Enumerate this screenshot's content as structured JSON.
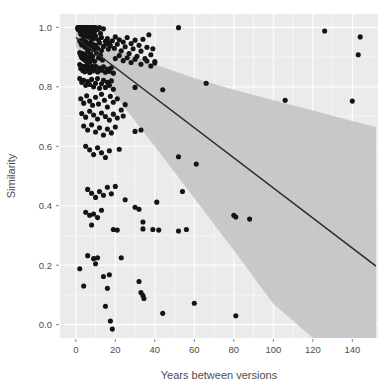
{
  "chart_data": {
    "type": "scatter",
    "title": "",
    "xlabel": "Years between versions",
    "ylabel": "Similarity",
    "xlim": [
      -8,
      153
    ],
    "ylim": [
      -0.045,
      1.045
    ],
    "xticks": [
      0,
      20,
      40,
      60,
      80,
      100,
      120,
      140
    ],
    "xticklabels": [
      "0",
      "20",
      "40",
      "60",
      "80",
      "100",
      "120",
      "140"
    ],
    "yticks": [
      0.0,
      0.2,
      0.4,
      0.6,
      0.8,
      1.0
    ],
    "yticklabels": [
      "0.0",
      "0.2",
      "0.4",
      "0.6",
      "0.8",
      "1.0"
    ],
    "grid": true,
    "grid_color": "#ffffff",
    "panel_background": "#ebebeb",
    "legend": null,
    "point_color": "#141414",
    "fit_line_color": "#2b2b2b",
    "ci_band_color": "#bfbfbf",
    "fit_line": {
      "label": "linear regression fit",
      "x": [
        0,
        152
      ],
      "y": [
        0.966,
        0.197
      ],
      "slope": -0.00506,
      "intercept": 0.966
    },
    "confidence_band": {
      "label": "95% confidence interval",
      "x": [
        0,
        20,
        40,
        60,
        80,
        100,
        120,
        140,
        152
      ],
      "upper": [
        0.995,
        0.93,
        0.875,
        0.83,
        0.79,
        0.755,
        0.72,
        0.685,
        0.665
      ],
      "lower": [
        0.935,
        0.77,
        0.6,
        0.425,
        0.25,
        0.07,
        -0.045,
        -0.045,
        -0.045
      ]
    },
    "points": [
      [
        1.0,
        0.999
      ],
      [
        1.0,
        0.996
      ],
      [
        1.2,
        0.993
      ],
      [
        1.5,
        0.999
      ],
      [
        1.8,
        0.996
      ],
      [
        2.0,
        0.999
      ],
      [
        2.0,
        0.99
      ],
      [
        2.2,
        0.985
      ],
      [
        2.5,
        0.999
      ],
      [
        2.5,
        0.978
      ],
      [
        2.8,
        0.996
      ],
      [
        3.0,
        0.999
      ],
      [
        3.0,
        0.991
      ],
      [
        3.0,
        0.975
      ],
      [
        3.2,
        0.999
      ],
      [
        3.5,
        0.994
      ],
      [
        3.5,
        0.982
      ],
      [
        3.8,
        0.999
      ],
      [
        4.0,
        0.999
      ],
      [
        4.0,
        0.988
      ],
      [
        4.0,
        0.972
      ],
      [
        4.2,
        0.999
      ],
      [
        4.5,
        0.993
      ],
      [
        4.5,
        0.98
      ],
      [
        4.8,
        0.999
      ],
      [
        5.0,
        0.999
      ],
      [
        5.0,
        0.986
      ],
      [
        5.0,
        0.97
      ],
      [
        5.2,
        0.996
      ],
      [
        5.5,
        0.999
      ],
      [
        5.5,
        0.983
      ],
      [
        5.8,
        0.991
      ],
      [
        6.0,
        0.999
      ],
      [
        6.0,
        0.977
      ],
      [
        6.2,
        0.994
      ],
      [
        6.5,
        0.999
      ],
      [
        6.5,
        0.968
      ],
      [
        6.8,
        0.987
      ],
      [
        7.0,
        0.999
      ],
      [
        7.0,
        0.981
      ],
      [
        7.5,
        0.996
      ],
      [
        7.5,
        0.965
      ],
      [
        8.0,
        0.999
      ],
      [
        8.0,
        0.974
      ],
      [
        8.5,
        0.99
      ],
      [
        9.0,
        0.999
      ],
      [
        9.0,
        0.962
      ],
      [
        9.5,
        0.985
      ],
      [
        10.0,
        0.999
      ],
      [
        10.0,
        0.971
      ],
      [
        11.0,
        0.993
      ],
      [
        11.5,
        0.958
      ],
      [
        12.0,
        0.999
      ],
      [
        12.5,
        0.979
      ],
      [
        13.0,
        0.966
      ],
      [
        14.0,
        0.995
      ],
      [
        15.0,
        0.953
      ],
      [
        2.0,
        0.955
      ],
      [
        2.5,
        0.948
      ],
      [
        3.0,
        0.941
      ],
      [
        3.5,
        0.958
      ],
      [
        4.0,
        0.945
      ],
      [
        4.5,
        0.935
      ],
      [
        5.0,
        0.952
      ],
      [
        5.5,
        0.93
      ],
      [
        6.0,
        0.946
      ],
      [
        6.5,
        0.938
      ],
      [
        7.0,
        0.928
      ],
      [
        7.5,
        0.95
      ],
      [
        8.0,
        0.934
      ],
      [
        8.5,
        0.943
      ],
      [
        9.0,
        0.925
      ],
      [
        10.0,
        0.94
      ],
      [
        11.0,
        0.93
      ],
      [
        12.0,
        0.948
      ],
      [
        13.0,
        0.922
      ],
      [
        14.0,
        0.936
      ],
      [
        15.5,
        0.944
      ],
      [
        16.5,
        0.927
      ],
      [
        17.5,
        0.939
      ],
      [
        2.0,
        0.915
      ],
      [
        2.5,
        0.905
      ],
      [
        3.0,
        0.898
      ],
      [
        3.5,
        0.912
      ],
      [
        4.0,
        0.893
      ],
      [
        4.5,
        0.908
      ],
      [
        5.0,
        0.888
      ],
      [
        5.5,
        0.901
      ],
      [
        6.0,
        0.918
      ],
      [
        6.5,
        0.896
      ],
      [
        7.0,
        0.884
      ],
      [
        7.5,
        0.91
      ],
      [
        8.0,
        0.892
      ],
      [
        8.5,
        0.902
      ],
      [
        9.5,
        0.886
      ],
      [
        10.5,
        0.913
      ],
      [
        11.5,
        0.897
      ],
      [
        12.5,
        0.906
      ],
      [
        13.5,
        0.89
      ],
      [
        2.0,
        0.875
      ],
      [
        2.5,
        0.862
      ],
      [
        3.0,
        0.87
      ],
      [
        3.5,
        0.855
      ],
      [
        4.0,
        0.868
      ],
      [
        4.5,
        0.851
      ],
      [
        5.0,
        0.864
      ],
      [
        5.5,
        0.872
      ],
      [
        6.0,
        0.858
      ],
      [
        6.5,
        0.866
      ],
      [
        7.0,
        0.848
      ],
      [
        7.5,
        0.861
      ],
      [
        8.0,
        0.87
      ],
      [
        8.5,
        0.853
      ],
      [
        9.0,
        0.865
      ],
      [
        9.5,
        0.857
      ],
      [
        10.0,
        0.869
      ],
      [
        11.0,
        0.85
      ],
      [
        12.0,
        0.863
      ],
      [
        13.0,
        0.856
      ],
      [
        14.0,
        0.867
      ],
      [
        15.0,
        0.849
      ],
      [
        16.0,
        0.86
      ],
      [
        17.0,
        0.852
      ],
      [
        18.0,
        0.864
      ],
      [
        19.0,
        0.846
      ],
      [
        16.0,
        0.962
      ],
      [
        17.0,
        0.948
      ],
      [
        18.5,
        0.955
      ],
      [
        19.5,
        0.93
      ],
      [
        20.0,
        0.968
      ],
      [
        21.0,
        0.943
      ],
      [
        22.0,
        0.958
      ],
      [
        23.0,
        0.921
      ],
      [
        24.0,
        0.951
      ],
      [
        25.0,
        0.935
      ],
      [
        26.0,
        0.966
      ],
      [
        27.0,
        0.912
      ],
      [
        28.0,
        0.946
      ],
      [
        29.0,
        0.928
      ],
      [
        30.0,
        0.957
      ],
      [
        31.0,
        0.903
      ],
      [
        32.0,
        0.94
      ],
      [
        33.0,
        0.92
      ],
      [
        34.0,
        0.96
      ],
      [
        35.0,
        0.895
      ],
      [
        36.0,
        0.933
      ],
      [
        37.0,
        0.975
      ],
      [
        38.0,
        0.908
      ],
      [
        39.0,
        0.928
      ],
      [
        40.0,
        0.88
      ],
      [
        20.0,
        0.895
      ],
      [
        22.0,
        0.905
      ],
      [
        24.0,
        0.888
      ],
      [
        26.0,
        0.898
      ],
      [
        28.0,
        0.882
      ],
      [
        30.0,
        0.893
      ],
      [
        33.0,
        0.876
      ],
      [
        36.0,
        0.887
      ],
      [
        38.0,
        0.87
      ],
      [
        40.0,
        0.885
      ],
      [
        2.0,
        0.828
      ],
      [
        3.0,
        0.815
      ],
      [
        4.0,
        0.822
      ],
      [
        5.0,
        0.805
      ],
      [
        6.0,
        0.818
      ],
      [
        7.0,
        0.808
      ],
      [
        8.0,
        0.825
      ],
      [
        9.0,
        0.8
      ],
      [
        10.0,
        0.812
      ],
      [
        11.0,
        0.828
      ],
      [
        12.0,
        0.795
      ],
      [
        13.0,
        0.81
      ],
      [
        14.0,
        0.822
      ],
      [
        15.0,
        0.798
      ],
      [
        16.0,
        0.815
      ],
      [
        17.0,
        0.805
      ],
      [
        18.0,
        0.82
      ],
      [
        19.0,
        0.792
      ],
      [
        30.0,
        0.798
      ],
      [
        44.0,
        0.79
      ],
      [
        66.0,
        0.812
      ],
      [
        2.5,
        0.76
      ],
      [
        4.0,
        0.745
      ],
      [
        5.5,
        0.77
      ],
      [
        7.0,
        0.752
      ],
      [
        8.5,
        0.738
      ],
      [
        10.0,
        0.765
      ],
      [
        11.5,
        0.742
      ],
      [
        13.0,
        0.775
      ],
      [
        14.5,
        0.755
      ],
      [
        16.0,
        0.732
      ],
      [
        17.5,
        0.768
      ],
      [
        19.0,
        0.748
      ],
      [
        21.0,
        0.76
      ],
      [
        23.0,
        0.722
      ],
      [
        25.0,
        0.74
      ],
      [
        106.0,
        0.755
      ],
      [
        140.0,
        0.752
      ],
      [
        3.0,
        0.71
      ],
      [
        5.0,
        0.698
      ],
      [
        7.0,
        0.718
      ],
      [
        9.0,
        0.705
      ],
      [
        11.0,
        0.692
      ],
      [
        13.0,
        0.712
      ],
      [
        15.0,
        0.7
      ],
      [
        17.0,
        0.688
      ],
      [
        19.0,
        0.708
      ],
      [
        21.0,
        0.695
      ],
      [
        24.0,
        0.702
      ],
      [
        4.0,
        0.668
      ],
      [
        6.0,
        0.655
      ],
      [
        8.0,
        0.672
      ],
      [
        10.0,
        0.648
      ],
      [
        12.0,
        0.662
      ],
      [
        14.0,
        0.638
      ],
      [
        16.0,
        0.658
      ],
      [
        18.0,
        0.645
      ],
      [
        20.0,
        0.665
      ],
      [
        30.0,
        0.65
      ],
      [
        33.0,
        0.655
      ],
      [
        5.0,
        0.6
      ],
      [
        7.0,
        0.588
      ],
      [
        9.0,
        0.572
      ],
      [
        11.0,
        0.595
      ],
      [
        13.0,
        0.578
      ],
      [
        15.0,
        0.562
      ],
      [
        17.0,
        0.585
      ],
      [
        22.0,
        0.59
      ],
      [
        52.0,
        0.565
      ],
      [
        61.0,
        0.54
      ],
      [
        6.0,
        0.455
      ],
      [
        8.0,
        0.442
      ],
      [
        10.0,
        0.428
      ],
      [
        12.0,
        0.448
      ],
      [
        14.0,
        0.435
      ],
      [
        16.0,
        0.462
      ],
      [
        18.0,
        0.44
      ],
      [
        20.0,
        0.465
      ],
      [
        25.0,
        0.42
      ],
      [
        41.0,
        0.412
      ],
      [
        54.0,
        0.448
      ],
      [
        5.0,
        0.378
      ],
      [
        7.0,
        0.368
      ],
      [
        9.0,
        0.372
      ],
      [
        11.0,
        0.36
      ],
      [
        13.0,
        0.385
      ],
      [
        30.0,
        0.395
      ],
      [
        32.0,
        0.388
      ],
      [
        34.0,
        0.345
      ],
      [
        80.0,
        0.368
      ],
      [
        81.0,
        0.362
      ],
      [
        88.0,
        0.355
      ],
      [
        8.0,
        0.335
      ],
      [
        19.0,
        0.32
      ],
      [
        21.0,
        0.318
      ],
      [
        34.0,
        0.322
      ],
      [
        39.0,
        0.32
      ],
      [
        42.0,
        0.318
      ],
      [
        52.0,
        0.315
      ],
      [
        56.0,
        0.32
      ],
      [
        2.0,
        0.188
      ],
      [
        6.0,
        0.232
      ],
      [
        9.0,
        0.222
      ],
      [
        10.0,
        0.205
      ],
      [
        11.0,
        0.225
      ],
      [
        14.0,
        0.162
      ],
      [
        17.0,
        0.168
      ],
      [
        23.0,
        0.225
      ],
      [
        4.0,
        0.13
      ],
      [
        16.0,
        0.122
      ],
      [
        32.0,
        0.145
      ],
      [
        33.0,
        0.108
      ],
      [
        34.0,
        0.098
      ],
      [
        34.5,
        0.088
      ],
      [
        15.0,
        0.062
      ],
      [
        17.5,
        0.012
      ],
      [
        18.5,
        -0.015
      ],
      [
        44.0,
        0.038
      ],
      [
        60.0,
        0.072
      ],
      [
        81.0,
        0.03
      ],
      [
        126.0,
        0.988
      ],
      [
        144.0,
        0.968
      ],
      [
        143.0,
        0.908
      ],
      [
        52.0,
        0.999
      ]
    ]
  },
  "figure": {
    "width": 384,
    "height": 387,
    "panel": {
      "left": 60,
      "right": 378,
      "top": 14,
      "bottom": 338
    }
  }
}
